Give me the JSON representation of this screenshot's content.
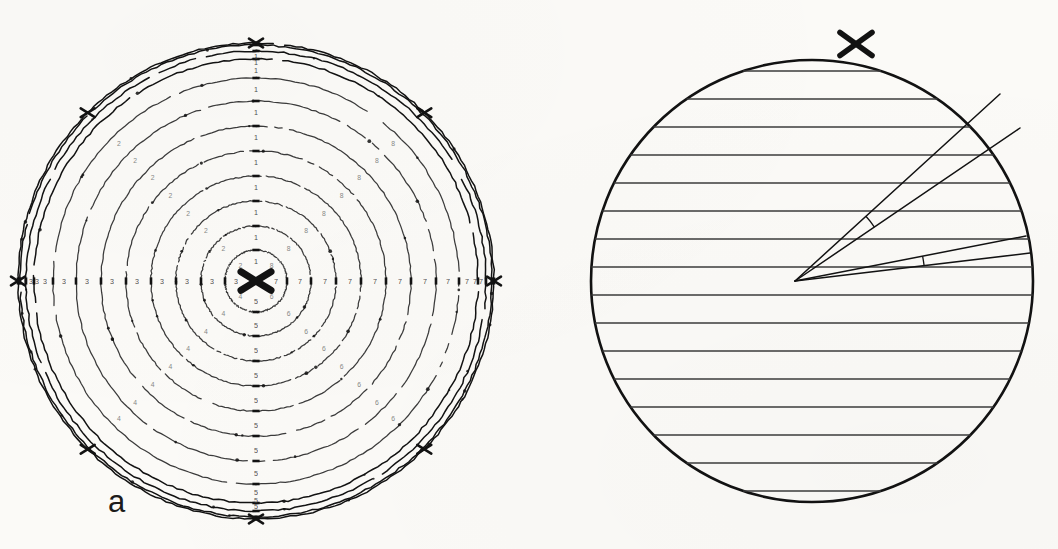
{
  "figure": {
    "type": "stereographic-projection-pair",
    "panels": [
      {
        "key": "a",
        "label": "a",
        "caption_letter": "a"
      },
      {
        "key": "b",
        "label": "b",
        "caption_letter": "b"
      }
    ]
  },
  "panel_a": {
    "label": "a",
    "center_marker": "X",
    "description": "concentric small-circle contours with numeric sector labels",
    "circle": {
      "cx": 256,
      "cy": 281,
      "r_outer": 238,
      "r_inner": 31
    },
    "ring_radii": [
      31,
      55,
      80,
      105,
      130,
      155,
      180,
      203,
      222,
      230,
      236,
      238
    ],
    "sector_labels": [
      {
        "digit": "1",
        "angle_deg": 90,
        "count": 11
      },
      {
        "digit": "2",
        "angle_deg": 135,
        "count": 8
      },
      {
        "digit": "3",
        "angle_deg": 180,
        "count": 11
      },
      {
        "digit": "4",
        "angle_deg": 225,
        "count": 8
      },
      {
        "digit": "5",
        "angle_deg": 270,
        "count": 11
      },
      {
        "digit": "6",
        "angle_deg": 315,
        "count": 8
      },
      {
        "digit": "7",
        "angle_deg": 0,
        "count": 11
      },
      {
        "digit": "8",
        "angle_deg": 45,
        "count": 8
      }
    ],
    "digits": [
      "1",
      "2",
      "3",
      "4",
      "5",
      "6",
      "7",
      "8"
    ],
    "tick_axes_deg": [
      0,
      90,
      180,
      270
    ],
    "cross_marks": [
      {
        "name": "center-cross",
        "angle_deg": 0,
        "r": 0
      },
      {
        "name": "rim-cross-left",
        "angle_deg": 180,
        "r": 238
      },
      {
        "name": "rim-cross-right",
        "angle_deg": 0,
        "r": 238
      },
      {
        "name": "rim-cross-upper-left",
        "angle_deg": 135,
        "r": 238
      },
      {
        "name": "rim-cross-upper-right",
        "angle_deg": 45,
        "r": 238
      },
      {
        "name": "rim-cross-lower-left",
        "angle_deg": 225,
        "r": 238
      },
      {
        "name": "rim-cross-lower-right",
        "angle_deg": 315,
        "r": 238
      },
      {
        "name": "rim-cross-top",
        "angle_deg": 90,
        "r": 238
      },
      {
        "name": "rim-cross-bottom",
        "angle_deg": 270,
        "r": 238
      }
    ]
  },
  "panel_b": {
    "label": "b",
    "description": "primitive circle ruled with parallel horizontal great-circle traces, pole marked X on upper rim, two measured angles at an interior vertex",
    "circle": {
      "cx": 812,
      "cy": 281,
      "r": 221
    },
    "pole_marker": "X",
    "pole_position": {
      "x": 856,
      "y": 44
    },
    "vertex": {
      "x": 795,
      "y": 281
    },
    "horizontal_line_count": 18,
    "horizontal_line_spacing_px": 28,
    "angle_rays": [
      {
        "name": "ray-upper-outer",
        "end_x": 1000,
        "end_y": 94
      },
      {
        "name": "ray-upper-inner",
        "end_x": 1020,
        "end_y": 128
      },
      {
        "name": "ray-lower-outer",
        "end_x": 1026,
        "end_y": 236
      },
      {
        "name": "ray-lower-inner",
        "end_x": 1030,
        "end_y": 253
      }
    ],
    "angle_arcs": [
      {
        "name": "upper-angle-arc",
        "radius_px": 96
      },
      {
        "name": "lower-angle-arc",
        "radius_px": 130
      }
    ]
  },
  "colors": {
    "ink": "#121212",
    "ink_soft": "#3b3b3b",
    "ink_faint": "#7a7a7a",
    "paper": "#fbfaf7"
  }
}
